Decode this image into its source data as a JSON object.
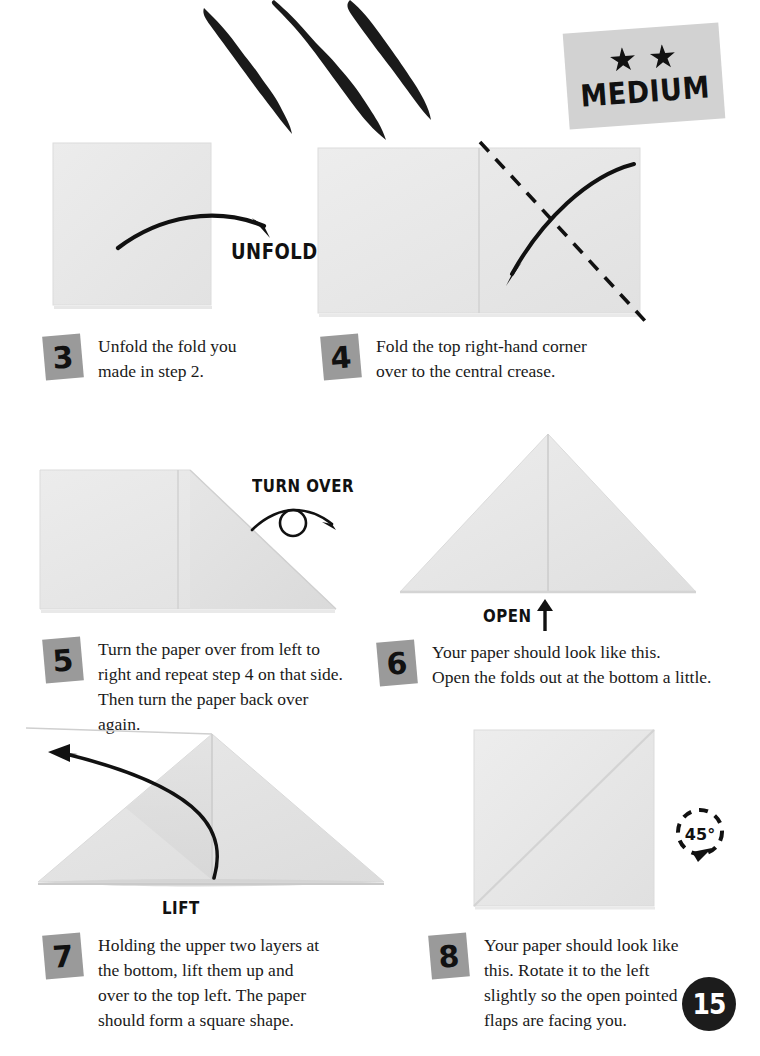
{
  "page": {
    "number": "15",
    "difficulty": {
      "label": "MEDIUM",
      "stars": 2,
      "star_icon": "star-icon",
      "background": "#d2d2d2"
    },
    "decoration": {
      "name": "claw-marks",
      "color": "#1a1a1a",
      "count": 3
    },
    "paper_color": "#e9e9e9",
    "ink_color": "#111111"
  },
  "steps": [
    {
      "number": "3",
      "text": "Unfold the fold you\nmade in step 2.",
      "diagram": "square-flat",
      "action_label": "UNFOLD"
    },
    {
      "number": "4",
      "text": "Fold the top right-hand corner\nover to the central crease.",
      "diagram": "wide-rectangle-with-diagonal-fold-line",
      "action_label": ""
    },
    {
      "number": "5",
      "text": "Turn the paper over from left to\nright and repeat step 4 on that side.\nThen turn the paper back over again.",
      "diagram": "rectangle-corner-folded",
      "action_label": "TURN OVER"
    },
    {
      "number": "6",
      "text": "Your paper should look like this.\nOpen the folds out at the bottom a little.",
      "diagram": "triangle-with-center-crease",
      "action_label": "OPEN"
    },
    {
      "number": "7",
      "text": "Holding the upper two layers at\nthe bottom, lift them up and\nover to the top left. The paper\nshould form a square shape.",
      "diagram": "wide-triangle-layered",
      "action_label": "LIFT"
    },
    {
      "number": "8",
      "text": "Your paper should look like\nthis. Rotate it to the left\nslightly so the open pointed\nflaps are facing you.",
      "diagram": "square-with-diagonal-crease",
      "action_label": ""
    }
  ],
  "rotation_marker": {
    "label": "45",
    "degree_symbol": "°",
    "direction": "counter-clockwise"
  }
}
